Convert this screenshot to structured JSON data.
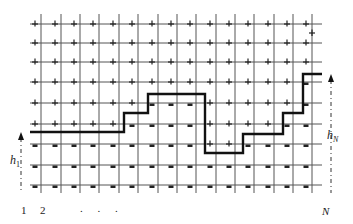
{
  "figure": {
    "grid": {
      "columns_x": [
        41,
        61,
        80,
        99,
        119,
        138,
        158,
        177,
        196,
        216,
        235,
        254,
        274,
        293,
        312
      ],
      "rows_y": [
        24,
        43,
        62,
        82,
        103,
        124,
        144,
        165,
        185
      ],
      "line_x_start": 30,
      "line_x_end": 322,
      "line_y_start": 14,
      "line_y_end": 193,
      "line_color": "#555555"
    },
    "interface_path": [
      [
        30,
        132
      ],
      [
        124,
        132
      ],
      [
        124,
        113
      ],
      [
        148,
        113
      ],
      [
        148,
        94
      ],
      [
        205,
        94
      ],
      [
        205,
        153
      ],
      [
        243,
        153
      ],
      [
        243,
        134
      ],
      [
        283,
        134
      ],
      [
        283,
        113
      ],
      [
        303,
        113
      ],
      [
        303,
        74
      ],
      [
        322,
        74
      ]
    ],
    "interface_color": "#111111",
    "plus_symbol": "+",
    "minus_symbol": "-",
    "extra_plus_marks": [
      [
        312,
        33
      ]
    ],
    "labels": {
      "h1": "h",
      "h1_sub": "1",
      "hN": "h",
      "hN_sub": "N",
      "x_label_1": "1",
      "x_label_2": "2",
      "x_label_dots": ". . .",
      "x_label_N": "N"
    },
    "arrows": {
      "left": {
        "x": 21,
        "y_top": 132,
        "y_bottom": 193
      },
      "right": {
        "x": 331,
        "y_top": 74,
        "y_bottom": 193
      }
    }
  }
}
